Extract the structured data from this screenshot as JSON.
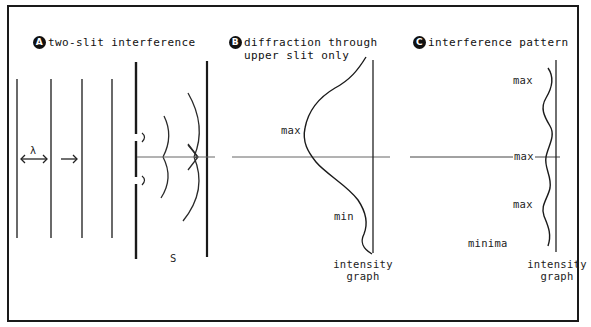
{
  "panels": [
    {
      "id": "A",
      "badge": "A",
      "title": "two-slit interference",
      "labels": {
        "wavelength": "λ",
        "screen": "S"
      }
    },
    {
      "id": "B",
      "badge": "B",
      "title_line1": "diffraction through",
      "title_line2": "upper slit only",
      "labels": {
        "max": "max",
        "min": "min",
        "graph_line1": "intensity",
        "graph_line2": "graph"
      }
    },
    {
      "id": "C",
      "badge": "C",
      "title": "interference pattern",
      "labels": {
        "max_top": "max",
        "max_center": "max",
        "max_bottom": "max",
        "minima": "minima",
        "graph_line1": "intensity",
        "graph_line2": "graph"
      }
    }
  ],
  "colors": {
    "ink": "#1a1a1a",
    "axis": "#555555",
    "background": "#ffffff"
  }
}
